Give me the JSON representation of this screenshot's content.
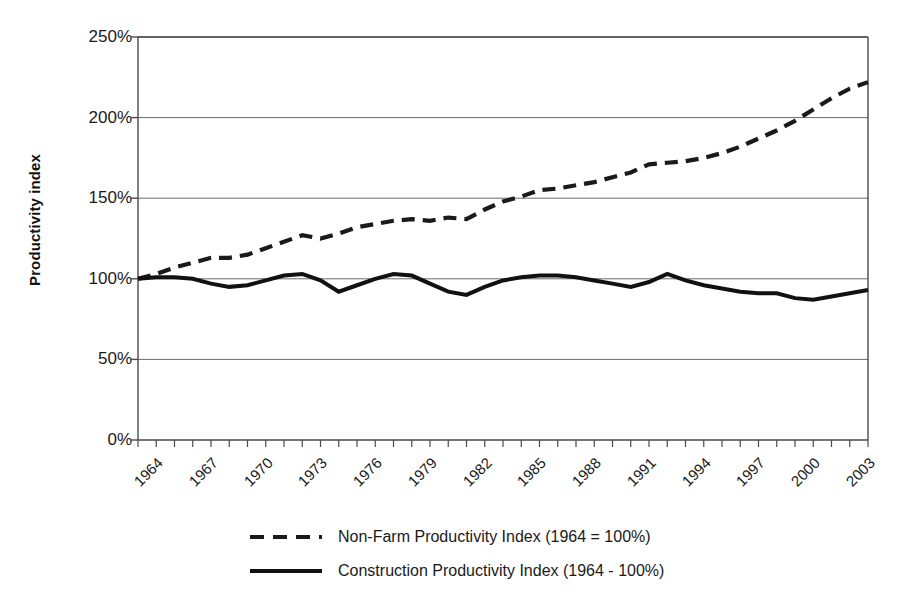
{
  "chart_data": {
    "type": "line",
    "title": "",
    "xlabel": "",
    "ylabel": "Productivity index",
    "ylim": [
      0,
      250
    ],
    "xlim": [
      1964,
      2004
    ],
    "grid": true,
    "legend_position": "bottom",
    "ytick_labels": [
      "0%",
      "50%",
      "100%",
      "150%",
      "200%",
      "250%"
    ],
    "ytick_values": [
      0,
      50,
      100,
      150,
      200,
      250
    ],
    "xtick_labels": [
      "1964",
      "1967",
      "1970",
      "1973",
      "1976",
      "1979",
      "1982",
      "1985",
      "1988",
      "1991",
      "1994",
      "1997",
      "2000",
      "2003"
    ],
    "xtick_values": [
      1964,
      1967,
      1970,
      1973,
      1976,
      1979,
      1982,
      1985,
      1988,
      1991,
      1994,
      1997,
      2000,
      2003
    ],
    "x": [
      1964,
      1965,
      1966,
      1967,
      1968,
      1969,
      1970,
      1971,
      1972,
      1973,
      1974,
      1975,
      1976,
      1977,
      1978,
      1979,
      1980,
      1981,
      1982,
      1983,
      1984,
      1985,
      1986,
      1987,
      1988,
      1989,
      1990,
      1991,
      1992,
      1993,
      1994,
      1995,
      1996,
      1997,
      1998,
      1999,
      2000,
      2001,
      2002,
      2003,
      2004
    ],
    "series": [
      {
        "name": "Non-Farm Productivity Index (1964 = 100%)",
        "style": "dashed",
        "color": "#1a1a1a",
        "values": [
          100,
          103,
          107,
          110,
          113,
          113,
          115,
          119,
          123,
          127,
          125,
          128,
          132,
          134,
          136,
          137,
          136,
          138,
          137,
          143,
          148,
          151,
          155,
          156,
          158,
          160,
          163,
          166,
          171,
          172,
          173,
          175,
          178,
          182,
          187,
          192,
          198,
          205,
          212,
          218,
          222
        ]
      },
      {
        "name": "Construction Productivity Index (1964 - 100%)",
        "style": "solid",
        "color": "#111111",
        "values": [
          100,
          101,
          101,
          100,
          97,
          95,
          96,
          99,
          102,
          103,
          99,
          92,
          96,
          100,
          103,
          102,
          97,
          92,
          90,
          95,
          99,
          101,
          102,
          102,
          101,
          99,
          97,
          95,
          98,
          103,
          99,
          96,
          94,
          92,
          91,
          91,
          88,
          87,
          89,
          91,
          93
        ]
      }
    ]
  },
  "legend": {
    "entries": [
      {
        "label": "Non-Farm Productivity Index (1964 = 100%)",
        "style": "dashed"
      },
      {
        "label": "Construction Productivity Index (1964 - 100%)",
        "style": "solid"
      }
    ]
  }
}
